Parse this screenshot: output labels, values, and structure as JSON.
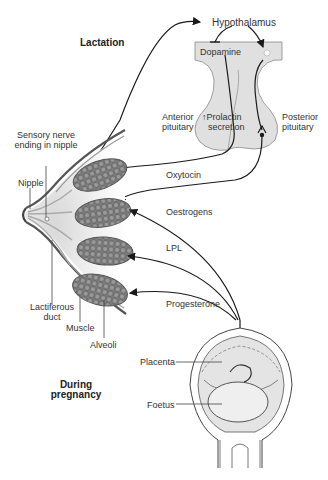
{
  "labels": {
    "lactation": "Lactation",
    "during_pregnancy_1": "During",
    "during_pregnancy_2": "pregnancy",
    "hypothalamus": "Hypothalamus",
    "dopamine": "Dopamine",
    "anterior_pituitary_1": "Anterior",
    "anterior_pituitary_2": "pituitary",
    "prolactin_1": "↑Prolactin",
    "prolactin_2": "secretion",
    "posterior_pituitary_1": "Posterior",
    "posterior_pituitary_2": "pituitary",
    "sensory_1": "Sensory nerve",
    "sensory_2": "ending in nipple",
    "nipple": "Nipple",
    "oxytocin": "Oxytocin",
    "oestrogens": "Oestrogens",
    "lpl": "LPL",
    "progesterone": "Progesterone",
    "lactiferous_1": "Lactiferous",
    "lactiferous_2": "duct",
    "muscle": "Muscle",
    "alveoli": "Alveoli",
    "placenta": "Placenta",
    "foetus": "Foetus"
  },
  "colors": {
    "tissue_fill": "#e2e2e2",
    "alveoli_fill": "#8a8a8a",
    "line": "#1a1a1a"
  }
}
